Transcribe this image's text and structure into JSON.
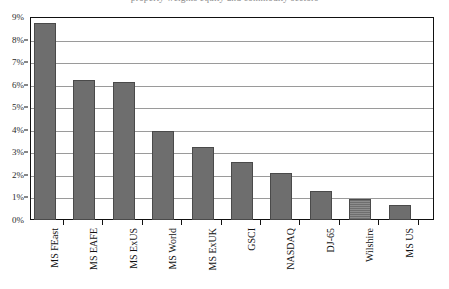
{
  "chart_data": {
    "type": "bar",
    "title": "property weights equity and commodity sectors",
    "xlabel": "",
    "ylabel": "",
    "ylim": [
      0,
      9
    ],
    "ytick_step": 1,
    "ytick_labels": [
      "0%",
      "1%",
      "2%",
      "3%",
      "4%",
      "5%",
      "6%",
      "7%",
      "8%",
      "9%"
    ],
    "ytick_values": [
      0,
      1,
      2,
      3,
      4,
      5,
      6,
      7,
      8,
      9
    ],
    "grid": true,
    "legend": "none",
    "categories": [
      "MS FEast",
      "MS EAFE",
      "MS ExUS",
      "MS World",
      "MS ExUK",
      "GSCI",
      "NASDAQ",
      "DJ-65",
      "Wilshire",
      "MS US"
    ],
    "values": [
      8.75,
      6.2,
      6.1,
      3.95,
      3.25,
      2.55,
      2.1,
      1.3,
      0.95,
      0.65
    ],
    "bar_color": "#6e6e6e",
    "bar_edge_color": "#4a4a4a",
    "gridline_color": "#9a9a9a",
    "frame_color": "#111111",
    "background_color": "#ffffff"
  }
}
